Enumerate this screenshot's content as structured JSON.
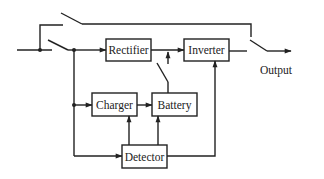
{
  "diagram": {
    "type": "block-diagram",
    "colors": {
      "stroke": "#222222",
      "background": "#ffffff"
    },
    "blocks": [
      {
        "id": "rectifier",
        "label": "Rectifier"
      },
      {
        "id": "inverter",
        "label": "Inverter"
      },
      {
        "id": "charger",
        "label": "Charger"
      },
      {
        "id": "battery",
        "label": "Battery"
      },
      {
        "id": "detector",
        "label": "Detector"
      }
    ],
    "output_label": "Output",
    "connections": [
      {
        "from": "input",
        "to": "rectifier",
        "via": "switch"
      },
      {
        "from": "input",
        "to": "output",
        "via": "bypass-switch"
      },
      {
        "from": "rectifier",
        "to": "inverter"
      },
      {
        "from": "battery",
        "to": "inverter",
        "via": "switch"
      },
      {
        "from": "inverter",
        "to": "output",
        "via": "output-switch"
      },
      {
        "from": "input",
        "to": "charger"
      },
      {
        "from": "charger",
        "to": "battery"
      },
      {
        "from": "input",
        "to": "detector"
      },
      {
        "from": "detector",
        "to": "charger"
      },
      {
        "from": "detector",
        "to": "battery"
      },
      {
        "from": "detector",
        "to": "inverter"
      }
    ]
  }
}
